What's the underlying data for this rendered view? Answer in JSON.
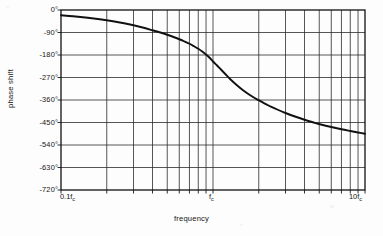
{
  "chart_data": {
    "type": "line",
    "title": "",
    "xlabel": "frequency",
    "ylabel": "phase shift",
    "xscale": "log",
    "xlim": [
      0.1,
      10
    ],
    "ylim": [
      -720,
      0
    ],
    "grid": true,
    "legend": null,
    "x_tick_labels": [
      {
        "value": 0.1,
        "label": "0.1f",
        "sub": "c"
      },
      {
        "value": 1,
        "label": "f",
        "sub": "c"
      },
      {
        "value": 10,
        "label": "10f",
        "sub": "c"
      }
    ],
    "y_tick_labels": [
      {
        "value": 0,
        "label": "0°"
      },
      {
        "value": -90,
        "label": "-90°"
      },
      {
        "value": -180,
        "label": "-180°"
      },
      {
        "value": -270,
        "label": "-270°"
      },
      {
        "value": -360,
        "label": "-360°"
      },
      {
        "value": -450,
        "label": "-450°"
      },
      {
        "value": -540,
        "label": "-540°"
      },
      {
        "value": -630,
        "label": "-630°"
      },
      {
        "value": -720,
        "label": "-720°"
      }
    ],
    "x_minor_gridlines": [
      0.1,
      0.2,
      0.3,
      0.4,
      0.5,
      0.6,
      0.7,
      0.8,
      0.9,
      1,
      2,
      3,
      4,
      5,
      6,
      7,
      8,
      9,
      10
    ],
    "series": [
      {
        "name": "phase shift",
        "color": "#111111",
        "x": [
          0.1,
          0.12,
          0.15,
          0.18,
          0.22,
          0.26,
          0.3,
          0.35,
          0.4,
          0.45,
          0.5,
          0.55,
          0.6,
          0.65,
          0.7,
          0.75,
          0.8,
          0.85,
          0.9,
          0.95,
          1.0,
          1.06,
          1.12,
          1.2,
          1.3,
          1.45,
          1.6,
          1.8,
          2.0,
          2.3,
          2.6,
          3.0,
          3.5,
          4.0,
          4.6,
          5.2,
          6.0,
          7.0,
          8.0,
          9.0,
          10.0
        ],
        "y": [
          -21,
          -25,
          -31,
          -37,
          -45,
          -53,
          -61,
          -71,
          -81,
          -90,
          -99,
          -108,
          -117,
          -126,
          -135,
          -145,
          -155,
          -166,
          -178,
          -191,
          -206,
          -221,
          -236,
          -255,
          -277,
          -303,
          -324,
          -345,
          -361,
          -381,
          -396,
          -412,
          -427,
          -439,
          -450,
          -459,
          -468,
          -477,
          -484,
          -490,
          -495
        ]
      }
    ]
  },
  "figure": {
    "x_axis_label": "frequency",
    "y_axis_label": "phase shift"
  }
}
